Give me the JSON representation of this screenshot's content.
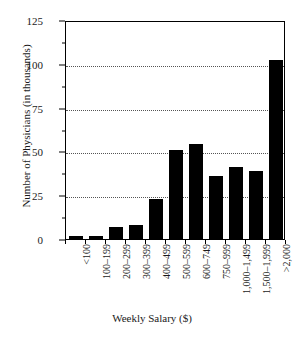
{
  "chart_data": {
    "type": "bar",
    "title": "",
    "subtitle": "",
    "xlabel": "Weekly Salary ($)",
    "ylabel": "Number of Physicians (in thousands)",
    "categories": [
      "<100",
      "100–199",
      "200–299",
      "300–399",
      "400–499",
      "500–599",
      "600–749",
      "750–999",
      "1,000–1,499",
      "1,500–1,999",
      ">2,000"
    ],
    "values": [
      1.5,
      1.5,
      7,
      8,
      23,
      51,
      54,
      36,
      41,
      39,
      102
    ],
    "ylim": [
      0,
      125
    ],
    "yticks": [
      0,
      25,
      50,
      75,
      100,
      125
    ],
    "ytick_labels": [
      "0",
      "25",
      "50",
      "75",
      "100",
      "125"
    ],
    "yminor_ticks": [
      12.5,
      37.5,
      62.5,
      87.5,
      112.5
    ],
    "gridlines": [
      25,
      50,
      75,
      100
    ],
    "grid": true,
    "grid_style": "dotted",
    "legend": "none",
    "bar_color": "#000000",
    "background_color": "#ffffff",
    "frame_color": "#000000",
    "x_tick_label_rotation": -90
  }
}
